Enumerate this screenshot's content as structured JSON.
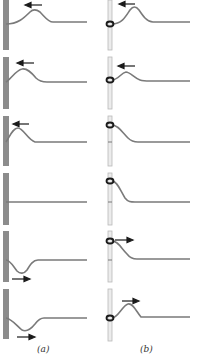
{
  "figure": {
    "colors": {
      "string": "#7a7a7a",
      "wall": "#8c8c8c",
      "rod": "#d4d4d4",
      "ring": "#1a1a1a",
      "arrow": "#1a1a1a"
    },
    "panels": [
      {
        "label": "(a)",
        "boundary": "fixed-wall",
        "frames": [
          {
            "pulse": "upright",
            "position": "approaching",
            "arrow": "left"
          },
          {
            "pulse": "upright",
            "position": "near-wall",
            "arrow": "left"
          },
          {
            "pulse": "upright",
            "position": "at-wall",
            "arrow": "left"
          },
          {
            "pulse": "none",
            "position": "cancelled",
            "arrow": "none"
          },
          {
            "pulse": "inverted",
            "position": "at-wall",
            "arrow": "right"
          },
          {
            "pulse": "inverted",
            "position": "leaving",
            "arrow": "right"
          }
        ]
      },
      {
        "label": "(b)",
        "boundary": "free-end-ring-on-rod",
        "frames": [
          {
            "pulse": "upright",
            "position": "approaching",
            "arrow": "left"
          },
          {
            "pulse": "upright",
            "position": "near-rod",
            "arrow": "left"
          },
          {
            "pulse": "upright",
            "position": "at-rod",
            "arrow": "none"
          },
          {
            "pulse": "upright",
            "position": "max-displacement",
            "arrow": "none"
          },
          {
            "pulse": "upright",
            "position": "at-rod",
            "arrow": "right"
          },
          {
            "pulse": "upright",
            "position": "leaving",
            "arrow": "right"
          }
        ]
      }
    ]
  }
}
